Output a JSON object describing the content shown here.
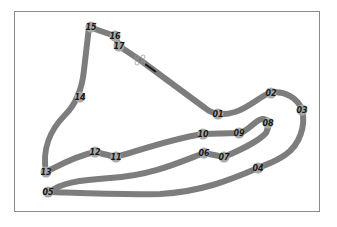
{
  "diagram": {
    "type": "race-circuit-map",
    "track_color": "#7d7d7d",
    "corner_marker_color": "#a8a8a8",
    "label_color": "#1a1a1a",
    "frame_color": "#8a8a8a",
    "corners": [
      {
        "id": "01",
        "x": 218,
        "y": 114
      },
      {
        "id": "02",
        "x": 271,
        "y": 93
      },
      {
        "id": "03",
        "x": 302,
        "y": 110
      },
      {
        "id": "04",
        "x": 258,
        "y": 168
      },
      {
        "id": "05",
        "x": 48,
        "y": 192
      },
      {
        "id": "06",
        "x": 204,
        "y": 153
      },
      {
        "id": "07",
        "x": 224,
        "y": 157
      },
      {
        "id": "08",
        "x": 268,
        "y": 123
      },
      {
        "id": "09",
        "x": 239,
        "y": 133
      },
      {
        "id": "10",
        "x": 203,
        "y": 134
      },
      {
        "id": "11",
        "x": 116,
        "y": 157
      },
      {
        "id": "12",
        "x": 95,
        "y": 152
      },
      {
        "id": "13",
        "x": 46,
        "y": 172
      },
      {
        "id": "14",
        "x": 80,
        "y": 97
      },
      {
        "id": "15",
        "x": 91,
        "y": 27
      },
      {
        "id": "16",
        "x": 115,
        "y": 36
      },
      {
        "id": "17",
        "x": 119,
        "y": 46
      }
    ],
    "start_finish": {
      "x": 140,
      "y": 60,
      "icon": "start-finish-line-icon"
    }
  }
}
